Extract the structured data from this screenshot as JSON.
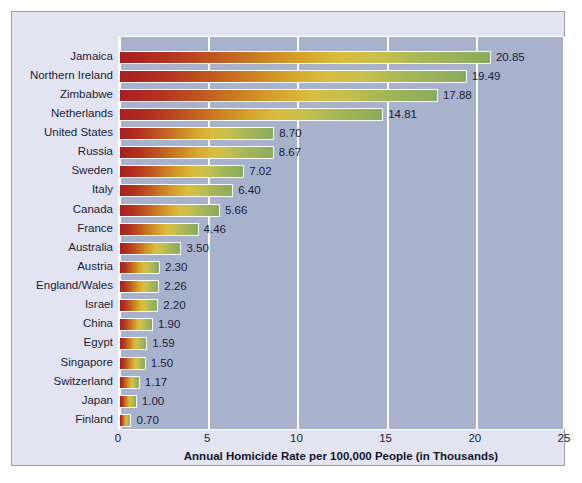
{
  "chart_data": {
    "type": "bar",
    "orientation": "horizontal",
    "title": "",
    "xlabel": "Annual Homicide Rate per 100,000 People (in Thousands)",
    "ylabel": "",
    "xlim": [
      0,
      25
    ],
    "xticks": [
      0,
      5,
      10,
      15,
      20,
      25
    ],
    "xtick_labels": [
      "0",
      "5",
      "10",
      "15",
      "20",
      "25"
    ],
    "grid": true,
    "grid_axis": "x",
    "legend": null,
    "categories": [
      "Jamaica",
      "Northern Ireland",
      "Zimbabwe",
      "Netherlands",
      "United States",
      "Russia",
      "Sweden",
      "Italy",
      "Canada",
      "France",
      "Australia",
      "Austria",
      "England/Wales",
      "Israel",
      "China",
      "Egypt",
      "Singapore",
      "Switzerland",
      "Japan",
      "Finland"
    ],
    "values": [
      20.85,
      19.49,
      17.88,
      14.81,
      8.7,
      8.67,
      7.02,
      6.4,
      5.66,
      4.46,
      3.5,
      2.3,
      2.26,
      2.2,
      1.9,
      1.59,
      1.5,
      1.17,
      1.0,
      0.7
    ],
    "value_labels": [
      "20.85",
      "19.49",
      "17.88",
      "14.81",
      "8.70",
      "8.67",
      "7.02",
      "6.40",
      "5.66",
      "4.46",
      "3.50",
      "2.30",
      "2.26",
      "2.20",
      "1.90",
      "1.59",
      "1.50",
      "1.17",
      "1.00",
      "0.70"
    ]
  },
  "style": {
    "figure_background": "#ffffff",
    "panel_background": "#e3e4f2",
    "panel_border": "#9a9aa8",
    "plot_background": "#a9b2cc",
    "gridline_color": "#fdfdfd",
    "bar_gradient_start": "#a81f21",
    "bar_gradient_mid": "#d6a52c",
    "bar_gradient_end": "#8aab5d",
    "bar_outline": "#fdfdfd",
    "text_color": "#1b1b38"
  }
}
